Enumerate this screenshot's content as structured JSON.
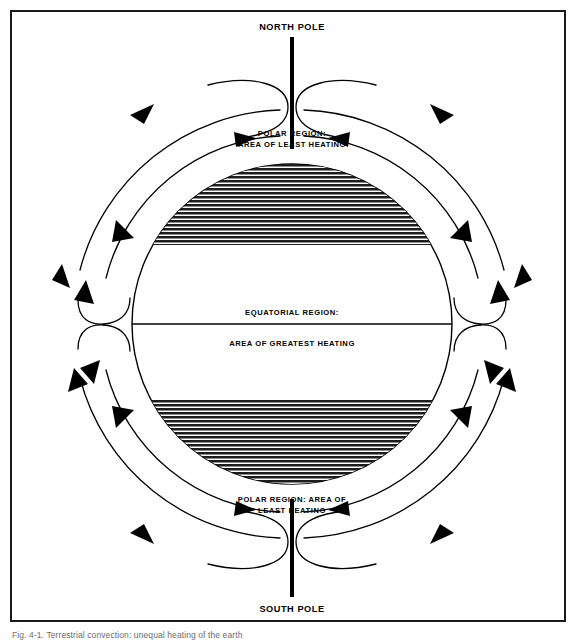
{
  "figure": {
    "caption": "Fig. 4-1. Terrestrial convection: unequal heating of the earth"
  },
  "diagram": {
    "type": "earth-circulation-cells",
    "labels": {
      "north_pole": "NORTH POLE",
      "south_pole": "SOUTH POLE",
      "north_polar_line1": "POLAR REGION:",
      "north_polar_line2": "AREA OF LEAST HEATING",
      "equator_line1": "EQUATORIAL REGION:",
      "equator_line2": "AREA OF GREATEST HEATING",
      "south_polar_line1": "POLAR REGION: AREA OF",
      "south_polar_line2": "LEAST HEATING"
    },
    "colors": {
      "ink": "#000000",
      "frame": "#1a1a1a",
      "hatch": "#1c1c1c",
      "background": "#ffffff",
      "caption": "#6d6d6d"
    },
    "geometry": {
      "center_x": 290,
      "center_y": 322,
      "globe_radius": 160,
      "inner_ring_radius": 188,
      "outer_ring_radius": 214,
      "equator_y": 322,
      "north_hatch_top": 147,
      "north_hatch_bottom": 243,
      "south_hatch_top": 398,
      "south_hatch_bottom": 496
    },
    "regions": [
      {
        "name": "north-polar-region",
        "heating": "least"
      },
      {
        "name": "equatorial-region",
        "heating": "greatest"
      },
      {
        "name": "south-polar-region",
        "heating": "least"
      }
    ]
  }
}
